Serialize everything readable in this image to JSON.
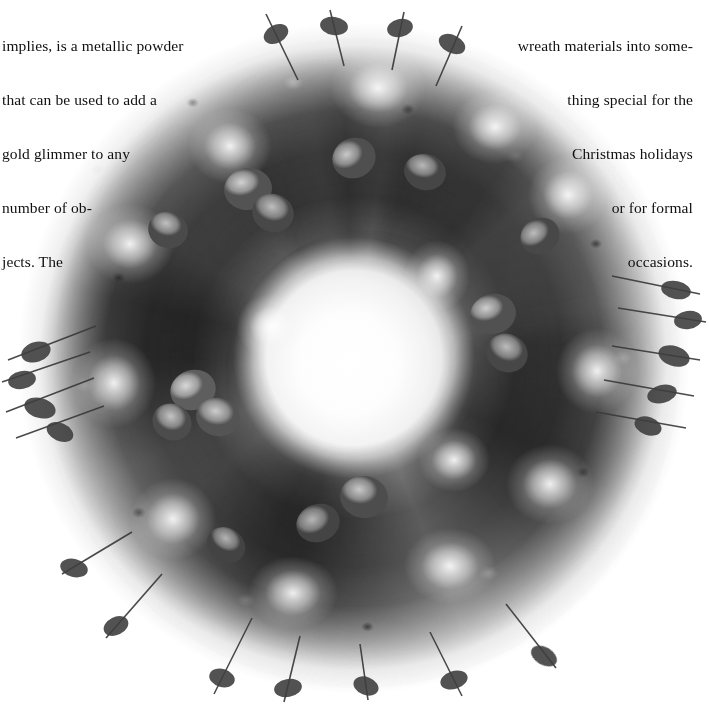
{
  "page": {
    "background_color": "#ffffff",
    "width": 709,
    "height": 710,
    "ink_color": "#101010"
  },
  "caption_left": {
    "name": "left-caption-text",
    "align": "left",
    "lines": [
      "implies, is a metallic powder",
      "that can be used to add a",
      "gold glimmer to any",
      "number of ob-",
      "jects. The"
    ]
  },
  "caption_right": {
    "name": "right-caption-text",
    "align": "right",
    "lines": [
      "wreath materials into some-",
      "thing special for the",
      "Christmas holidays",
      "or for formal",
      "occasions."
    ]
  },
  "photo": {
    "name": "eucalyptus-wreath-photograph",
    "subject": "dried eucalyptus wreath with baby's breath",
    "rendering": "black-and-white halftone scan",
    "center_x": 355,
    "center_y": 360,
    "outer_radius": 336,
    "inner_radius": 98,
    "tones": {
      "highlight": "#dcdcdc",
      "midtone": "#6e6e6e",
      "shadow": "#2a2a2a",
      "deep_shadow": "#141414",
      "filler_white": "#ffffff"
    }
  }
}
